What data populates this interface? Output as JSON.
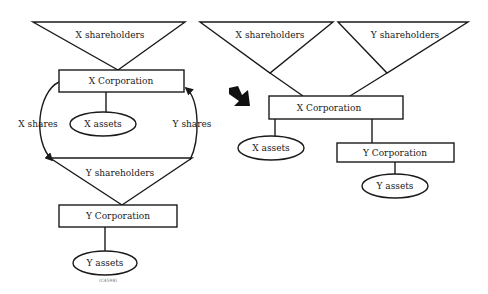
{
  "diagram": {
    "before": {
      "x_shareholders": "X shareholders",
      "x_corporation": "X Corporation",
      "x_assets": "X assets",
      "x_shares": "X shares",
      "y_shares": "Y shares",
      "y_shareholders": "Y shareholders",
      "y_corporation": "Y Corporation",
      "y_assets": "Y assets",
      "caption": "(C4598)"
    },
    "after": {
      "x_shareholders": "X shareholders",
      "y_shareholders": "Y shareholders",
      "x_corporation": "X Corporation",
      "x_assets": "X assets",
      "y_corporation": "Y Corporation",
      "y_assets": "Y assets"
    },
    "transition_arrow": "arrow-right-down"
  }
}
